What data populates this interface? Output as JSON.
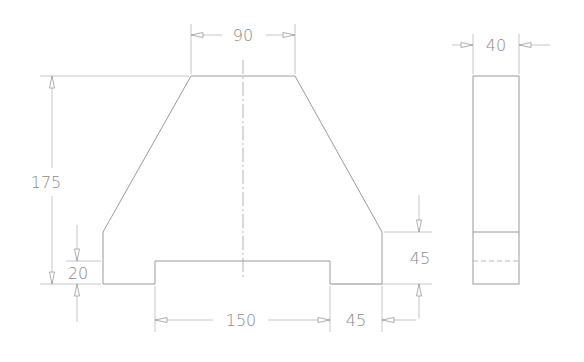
{
  "drawing": {
    "title": "Two-view orthographic drawing of trapezoidal block with bottom slot",
    "units": "mm",
    "views": [
      "front-view",
      "side-view"
    ],
    "dimensions": {
      "top_width": "90",
      "overall_height": "175",
      "side_step_height": "20",
      "slot_width": "150",
      "shoulder_width": "45",
      "right_step_height": "45",
      "thickness": "40"
    },
    "colors": {
      "line": "#9a9a9a",
      "text": "#8a8a8a",
      "background": "#ffffff"
    }
  }
}
